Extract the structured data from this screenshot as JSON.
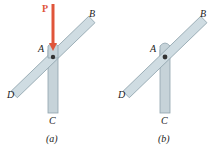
{
  "figures": [
    {
      "id": "a",
      "caption": "(a)",
      "labels": {
        "force": "P",
        "pin": "A",
        "top_end": "B",
        "bottom_end": "C",
        "left_end": "D"
      },
      "has_force": true
    },
    {
      "id": "b",
      "caption": "(b)",
      "labels": {
        "pin": "A",
        "top_end": "B",
        "bottom_end": "C",
        "left_end": "D"
      },
      "has_force": false
    }
  ],
  "colors": {
    "bar_fill": "#c9d6dc",
    "bar_edge": "#8fa3ad",
    "force": "#e0553a",
    "pin": "#333333"
  }
}
